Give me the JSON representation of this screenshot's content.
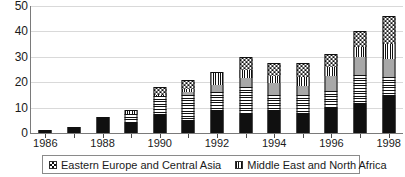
{
  "chart_data": {
    "type": "bar",
    "stacked": true,
    "title": "",
    "subtitle": "",
    "xlabel": "",
    "ylabel": "",
    "ylim": [
      0,
      50
    ],
    "yticks": [
      0,
      10,
      20,
      30,
      40,
      50
    ],
    "grid": true,
    "legend_position": "bottom",
    "categories": [
      "1986",
      "1987",
      "1988",
      "1989",
      "1990",
      "1991",
      "1992",
      "1993",
      "1994",
      "1995",
      "1996",
      "1997",
      "1998"
    ],
    "xtick_labels_shown": [
      "1986",
      "1988",
      "1990",
      "1992",
      "1994",
      "1996",
      "1998"
    ],
    "series": [
      {
        "name": "segment-1-solid-black",
        "pattern": "solid-black",
        "values": [
          1,
          2,
          6,
          4,
          7,
          5,
          9,
          8,
          9,
          8,
          10,
          12,
          15
        ]
      },
      {
        "name": "segment-2-horizontal-stripes",
        "pattern": "hstripe",
        "values": [
          0,
          0.5,
          0.5,
          3.5,
          7.5,
          10,
          7,
          10,
          6,
          7,
          6.5,
          11,
          7
        ]
      },
      {
        "name": "segment-3-solid-gray",
        "pattern": "solid-gray",
        "values": [
          0,
          0,
          0,
          0,
          0,
          1,
          3,
          3.5,
          4.5,
          3.5,
          6,
          7,
          7
        ]
      },
      {
        "name": "segment-4-vertical-stripes",
        "pattern": "vstripe",
        "values": [
          0,
          0,
          0,
          1.5,
          0.5,
          1.5,
          5,
          3.5,
          3,
          3.5,
          3.5,
          4,
          6
        ]
      },
      {
        "name": "segment-5-checkered",
        "pattern": "checker",
        "values": [
          0,
          0,
          0,
          0,
          3,
          3.5,
          0,
          5,
          5,
          5.5,
          5,
          6,
          11
        ]
      }
    ],
    "totals": [
      1,
      2.5,
      6.5,
      9,
      18,
      21,
      24,
      30,
      27.5,
      27.5,
      31,
      40,
      46
    ],
    "legend": [
      {
        "label": "Eastern Europe and Central Asia",
        "pattern": "checker"
      },
      {
        "label": "Middle East and North Africa",
        "pattern": "vstripe"
      }
    ],
    "colors": {
      "ink": "#101010",
      "gray_fill": "#a8a8a8",
      "gridline": "#d9d9d9",
      "axis": "#7a7a7a",
      "background": "#ffffff"
    }
  }
}
